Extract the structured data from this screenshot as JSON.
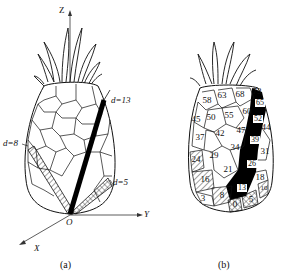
{
  "figure_a": {
    "caption": "(a)",
    "axes": {
      "z": "Z",
      "y": "Y",
      "x": "X",
      "origin": "O"
    },
    "parastichy_labels": {
      "d13": "d=13",
      "d8": "d=8",
      "d5": "d=5"
    }
  },
  "figure_b": {
    "caption": "(b)",
    "scale_numbers": [
      "58",
      "63",
      "68",
      "73",
      "65",
      "50",
      "55",
      "60",
      "52",
      "45",
      "47",
      "44",
      "37",
      "42",
      "39",
      "34",
      "31",
      "24",
      "29",
      "26",
      "21",
      "16",
      "18",
      "13",
      "8",
      "3",
      "10",
      "0",
      "5"
    ]
  }
}
